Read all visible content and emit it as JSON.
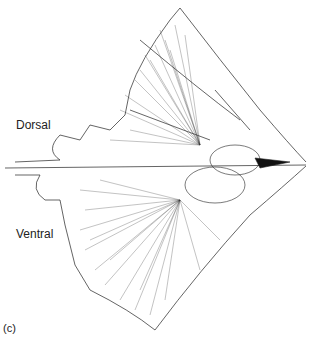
{
  "figure": {
    "labels": {
      "dorsal": "Dorsal",
      "ventral": "Ventral",
      "panel": "(c)"
    },
    "colors": {
      "line": "#222222",
      "background": "#ffffff"
    }
  }
}
